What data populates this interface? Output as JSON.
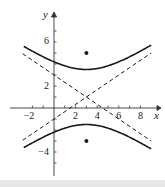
{
  "chart_data": {
    "type": "line",
    "title": "",
    "xlabel": "x",
    "ylabel": "y",
    "xlim": [
      -3,
      9.5
    ],
    "ylim": [
      -6.5,
      9
    ],
    "grid": false,
    "x_ticks": [
      -2,
      2,
      4,
      6,
      8
    ],
    "x_tick_labels": [
      "−2",
      "2",
      "4",
      "6",
      "8"
    ],
    "y_ticks": [
      -4,
      2,
      6
    ],
    "y_tick_labels": [
      "−4",
      "2",
      "6"
    ],
    "x_minor_ticks": [
      -2,
      -1,
      1,
      2,
      3,
      4,
      5,
      6,
      7,
      8
    ],
    "y_minor_ticks": [
      -5,
      -4,
      -3,
      -2,
      -1,
      1,
      2,
      3,
      4,
      5,
      6,
      7
    ],
    "center": [
      3,
      1
    ],
    "vertices": [
      [
        3,
        3.5
      ],
      [
        3,
        -1.5
      ]
    ],
    "foci": [
      [
        3,
        5
      ],
      [
        3,
        -3
      ]
    ],
    "series": [
      {
        "name": "hyperbola upper branch",
        "style": "solid",
        "x_range": [
          -2.8,
          9
        ]
      },
      {
        "name": "hyperbola lower branch",
        "style": "solid",
        "x_range": [
          -2.8,
          9
        ]
      },
      {
        "name": "asymptote 1",
        "style": "dashed",
        "slope": 0.667,
        "passes_through": [
          3,
          1
        ]
      },
      {
        "name": "asymptote 2",
        "style": "dashed",
        "slope": -0.667,
        "passes_through": [
          3,
          1
        ]
      }
    ],
    "points": [
      {
        "label": "focus upper",
        "x": 3,
        "y": 5
      },
      {
        "label": "focus lower",
        "x": 3,
        "y": -3
      }
    ],
    "legend": null,
    "colors": {
      "curve": "#1a1a1a",
      "asymptote": "#1a1a1a",
      "axis": "#333333"
    }
  },
  "axes": {
    "x_label": "x",
    "y_label": "y"
  },
  "ticks": {
    "x": [
      "−2",
      "2",
      "4",
      "6",
      "8"
    ],
    "y": [
      "6",
      "2",
      "−4"
    ]
  }
}
